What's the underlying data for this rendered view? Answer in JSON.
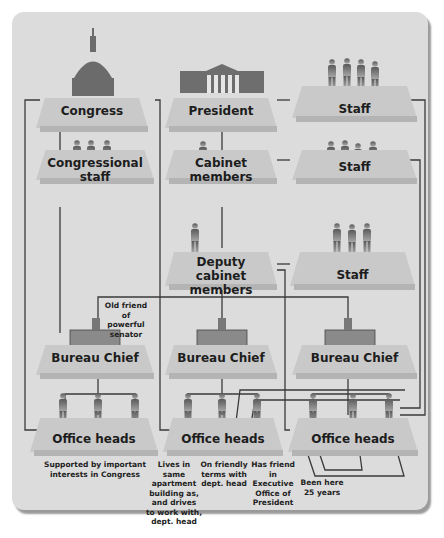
{
  "diagram": {
    "top_row": {
      "congress": "Congress",
      "president": "President",
      "staff": "Staff"
    },
    "second_row": {
      "congressional_staff": "Congressional staff",
      "cabinet_members": "Cabinet members",
      "staff": "Staff"
    },
    "third_row": {
      "deputy_line1": "Deputy",
      "deputy_line2": "cabinet members",
      "staff": "Staff"
    },
    "bureau_row": {
      "left": "Bureau Chief",
      "middle": "Bureau Chief",
      "right": "Bureau Chief"
    },
    "office_row": {
      "left": "Office heads",
      "middle": "Office heads",
      "right": "Office heads"
    },
    "annotations": {
      "old_friend": [
        "Old friend of",
        "powerful",
        "senator"
      ],
      "supported": [
        "Supported by important",
        "interests in Congress"
      ],
      "lives_same": [
        "Lives in same",
        "apartment",
        "building as,",
        "and drives",
        "to work with,",
        "dept. head"
      ],
      "friendly_terms": [
        "On friendly",
        "terms with",
        "dept. head"
      ],
      "has_friend": [
        "Has friend in",
        "Executive",
        "Office of",
        "President"
      ],
      "been_here": [
        "Been here",
        "25 years"
      ]
    },
    "icons": [
      "capitol-dome-icon",
      "white-house-icon",
      "person-figure-icon",
      "desk-icon"
    ],
    "colors": {
      "panel": "#dcdcdc",
      "platform": "#c9c9c9",
      "line": "#3a3a3a",
      "figure": "#6e6e6e"
    }
  }
}
